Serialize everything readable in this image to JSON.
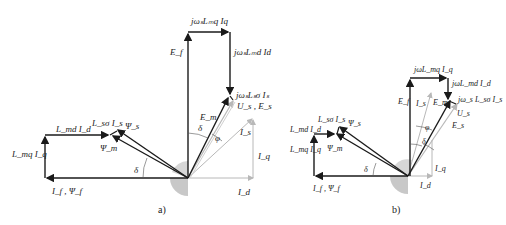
{
  "diagrams": [
    {
      "id": "a",
      "caption": "a)",
      "labels": {
        "jw_Lmq_Iq": "jωₛLₘq Iq",
        "jw_Lmd_Id": "jωₛLₘd Id",
        "jw_Lsa_Is": "jωₛLₛσ Iₛ",
        "Ef": "E_f",
        "Em": "E_m",
        "Us_Es": "U_s , E_s",
        "Is": "I_s",
        "Iq": "I_q",
        "Id": "I_d",
        "delta_top": "δ",
        "phi": "φ",
        "Lmd_Id": "L_md I_d",
        "Lsa_Is": "L_sσ I_s",
        "Psi_s": "Ψ_s",
        "Psi_m": "Ψ_m",
        "Lmq_Iq": "L_mq I_q",
        "delta_left": "δ",
        "If_Psif": "I_f , Ψ_f"
      }
    },
    {
      "id": "b",
      "caption": "b)",
      "labels": {
        "jw_Lmq_Iq": "jωL_mq I_q",
        "jw_Lmd_Id": "jωL_md I_d",
        "jw_Lsa_Is": "jω_s L_sσ I_s",
        "Ef": "E_f",
        "Is": "I_s",
        "Em": "E_m",
        "Us": "U_s",
        "Es": "E_s",
        "phi": "φ",
        "delta_top": "δ",
        "Iq": "I_q",
        "Id": "I_d",
        "Lmd_Id": "L_md I_d",
        "Lsa_Is": "L_sσ I_s",
        "Psi_s": "Ψ_s",
        "Psi_m": "Ψ_m",
        "Lmq_Iq": "L_mq I_q",
        "delta_left": "δ",
        "If_Psif": "I_f , Ψ_f"
      }
    }
  ],
  "colors": {
    "dark_line": "#1a1a1a",
    "light_line": "#b8b8b8",
    "sector": "#c8c8c8"
  }
}
